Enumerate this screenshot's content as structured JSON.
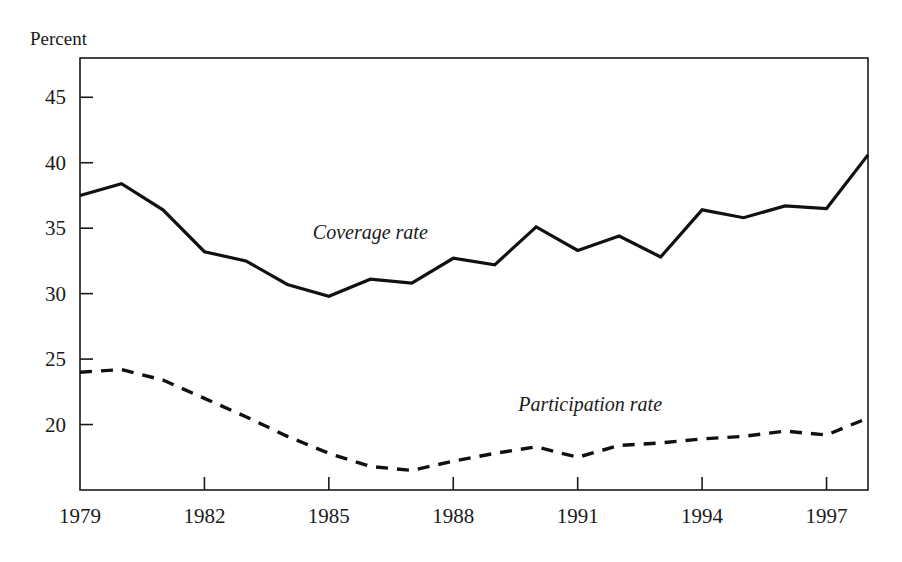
{
  "chart_data": {
    "type": "line",
    "title": "",
    "ylabel": "Percent",
    "xlabel": "",
    "grid": false,
    "legend_position": "inline-annotation",
    "x": [
      1979,
      1980,
      1981,
      1982,
      1983,
      1984,
      1985,
      1986,
      1987,
      1988,
      1989,
      1990,
      1991,
      1992,
      1993,
      1994,
      1995,
      1996,
      1997,
      1998
    ],
    "xtick_labels": [
      "1979",
      "1982",
      "1985",
      "1988",
      "1991",
      "1994",
      "1997"
    ],
    "xticks": [
      1979,
      1982,
      1985,
      1988,
      1991,
      1994,
      1997
    ],
    "xlim": [
      1979,
      1998
    ],
    "ytick_labels": [
      "45",
      "40",
      "35",
      "30",
      "25",
      "20"
    ],
    "yticks": [
      45,
      40,
      35,
      30,
      25,
      20
    ],
    "ylim": [
      15.0,
      48.0
    ],
    "series": [
      {
        "name": "Coverage rate",
        "style": "solid",
        "label_x": 1986.0,
        "label_y": 34.2,
        "values": [
          37.5,
          38.4,
          36.4,
          33.2,
          32.5,
          30.7,
          29.8,
          31.1,
          30.8,
          32.7,
          32.2,
          35.1,
          33.3,
          34.4,
          32.8,
          36.4,
          35.8,
          36.7,
          36.5,
          40.6
        ]
      },
      {
        "name": "Participation rate",
        "style": "dashed",
        "label_x": 1991.3,
        "label_y": 21.0,
        "values": [
          24.0,
          24.2,
          23.4,
          22.0,
          20.6,
          19.1,
          17.8,
          16.8,
          16.5,
          17.2,
          17.8,
          18.3,
          17.5,
          18.4,
          18.6,
          18.9,
          19.1,
          19.5,
          19.2,
          20.5
        ]
      }
    ]
  }
}
